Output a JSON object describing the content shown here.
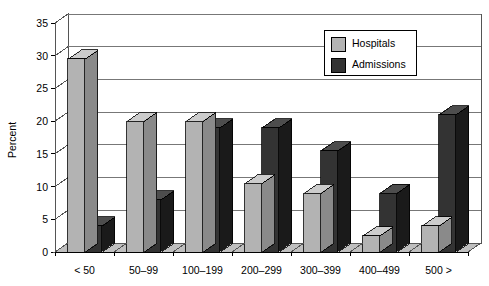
{
  "chart_data": {
    "type": "bar",
    "title": "",
    "subtitle": "",
    "xlabel": "",
    "ylabel": "Percent",
    "ylim": [
      0,
      35
    ],
    "yticks": [
      0,
      5,
      10,
      15,
      20,
      25,
      30,
      35
    ],
    "ytick_labels": [
      "0",
      "5",
      "10",
      "15",
      "20",
      "25",
      "30",
      "35"
    ],
    "grid": true,
    "grid_axis": "y",
    "legend_position": "top-right",
    "style": "3d-grouped-bars",
    "categories": [
      "< 50",
      "50–99",
      "100–199",
      "200–299",
      "300–399",
      "400–499",
      "500 >"
    ],
    "series": [
      {
        "name": "Hospitals",
        "color": "#b3b3b3",
        "values": [
          29.5,
          20.0,
          20.0,
          10.5,
          9.0,
          2.5,
          4.0
        ]
      },
      {
        "name": "Admissions",
        "color": "#333333",
        "values": [
          4.0,
          8.0,
          19.0,
          19.0,
          15.5,
          9.0,
          21.0
        ]
      }
    ],
    "legend": [
      {
        "label": "Hospitals",
        "color": "#b3b3b3"
      },
      {
        "label": "Admissions",
        "color": "#333333"
      }
    ],
    "colors": {
      "hospitals": "#b3b3b3",
      "admissions": "#333333",
      "hospitals_top": "#cccccc",
      "hospitals_side": "#8a8a8a",
      "admissions_top": "#4d4d4d",
      "admissions_side": "#1a1a1a",
      "axis": "#555555",
      "grid": "#777777",
      "floor": "#bfbfbf",
      "background": "#ffffff"
    }
  }
}
